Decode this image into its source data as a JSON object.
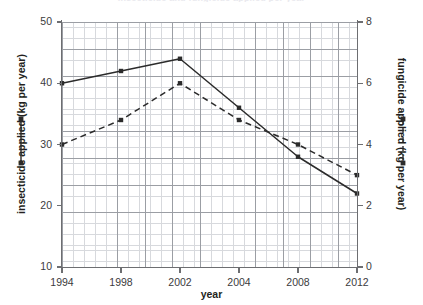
{
  "chart_data": {
    "type": "line",
    "title": "insecticide and fungicide applied per year",
    "xlabel": "year",
    "ylabel": "insecticide applied (kg per year)",
    "y2label": "fungicide applied (kg per year)",
    "categories": [
      "1994",
      "1998",
      "2002",
      "2004",
      "2008",
      "2012"
    ],
    "xticklabels": [
      "1994",
      "1998",
      "2002",
      "2004",
      "2008",
      "2012"
    ],
    "yticklabels": [
      "10",
      "20",
      "30",
      "40",
      "50"
    ],
    "yticks": [
      10,
      20,
      30,
      40,
      50
    ],
    "ylim": [
      10,
      50
    ],
    "y2ticklabels": [
      "0",
      "2",
      "4",
      "6",
      "8"
    ],
    "y2ticks": [
      0,
      2,
      4,
      6,
      8
    ],
    "y2lim": [
      0,
      8
    ],
    "grid": true,
    "grid_minor": true,
    "legend_position": "outside-left-and-right",
    "series": [
      {
        "name": "insecticide applied (kg per year)",
        "axis": "left",
        "style": "solid",
        "marker": "square",
        "color": "#2b2b2b",
        "values": [
          40,
          42,
          44,
          36,
          28,
          22
        ]
      },
      {
        "name": "fungicide applied (kg per year)",
        "axis": "right",
        "style": "dashed",
        "marker": "square",
        "color": "#2b2b2b",
        "values": [
          4.0,
          4.8,
          6.0,
          4.8,
          4.0,
          3.0
        ]
      }
    ]
  },
  "axes": {
    "left": {
      "title": "insecticide applied (kg per year)",
      "labels": [
        "50",
        "40",
        "30",
        "20",
        "10"
      ]
    },
    "right": {
      "title": "fungicide applied (kg per year)",
      "labels": [
        "8",
        "6",
        "4",
        "2",
        "0"
      ]
    },
    "bottom": {
      "title": "year",
      "labels": [
        "1994",
        "1998",
        "2002",
        "2004",
        "2008",
        "2012"
      ]
    }
  },
  "legend": {
    "left_series_name": "insecticide applied (kg per year)",
    "right_series_name": "fungicide applied (kg per year)"
  },
  "colors": {
    "line": "#2b2b2b",
    "axis": "#6d6e71",
    "grid_major": "#9b9ea4",
    "grid_minor": "#d7d9dd",
    "text": "#231f20"
  }
}
